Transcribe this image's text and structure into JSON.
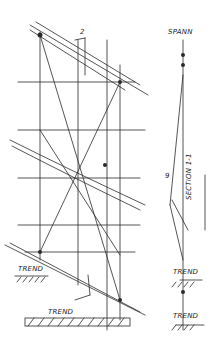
{
  "diagram": {
    "type": "hand-drawn structural sketch",
    "labels": {
      "top_right": "SPANN",
      "section": "SECTION 1-1",
      "ground_left": "TREND",
      "ground_bottom": "TREND",
      "ground_right_1": "TREND",
      "ground_right_2": "TREND",
      "marker_top": "2",
      "marker_mid": "9"
    },
    "colors": {
      "ink": "#2a2a2a",
      "paper": "#ffffff"
    }
  }
}
